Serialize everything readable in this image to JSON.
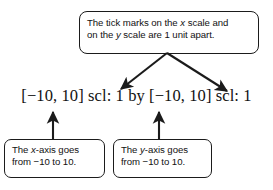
{
  "figure": {
    "expression": "[−10, 10] scl: 1 by [−10, 10] scl: 1",
    "ink_color": "#1b1b1b",
    "text_color": "#111111",
    "background": "#ffffff"
  },
  "callout_top": {
    "name": "tick-marks-callout",
    "line1_a": "The tick marks on the ",
    "line1_var": "x",
    "line1_b": " scale and",
    "line2_a": "on the ",
    "line2_var": "y",
    "line2_b": " scale are 1 unit apart."
  },
  "callout_x": {
    "name": "x-axis-callout",
    "line1_a": "The ",
    "line1_var": "x",
    "line1_b": "-axis goes",
    "line2": "from −10 to 10."
  },
  "callout_y": {
    "name": "y-axis-callout",
    "line1_a": "The ",
    "line1_var": "y",
    "line1_b": "-axis goes",
    "line2": "from −10 to 10."
  },
  "arrows": [
    {
      "name": "arrow-top-to-left-interval",
      "direction": "down-left",
      "from": [
        167,
        53
      ],
      "to": [
        119,
        91
      ]
    },
    {
      "name": "arrow-top-to-right-interval",
      "direction": "down-right",
      "from": [
        167,
        53
      ],
      "to": [
        229,
        93
      ]
    },
    {
      "name": "arrow-x-callout-to-expression",
      "direction": "up",
      "from": [
        53,
        139
      ],
      "to": [
        53,
        110
      ]
    },
    {
      "name": "arrow-y-callout-to-expression",
      "direction": "up",
      "from": [
        159,
        139
      ],
      "to": [
        159,
        110
      ]
    }
  ]
}
